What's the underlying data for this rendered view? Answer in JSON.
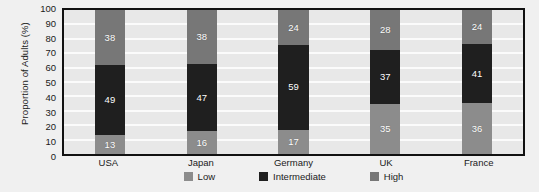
{
  "chart_data": {
    "type": "bar",
    "subtype": "stacked-column-100",
    "title": "",
    "xlabel": "",
    "ylabel": "Proportion of Adults (%)",
    "ylim": [
      0,
      100
    ],
    "yticks": [
      100,
      90,
      80,
      70,
      60,
      50,
      40,
      30,
      20,
      10,
      0
    ],
    "grid": true,
    "grid_orientation": "horizontal",
    "legend_position": "bottom-center",
    "categories": [
      "USA",
      "Japan",
      "Germany",
      "UK",
      "France"
    ],
    "stack_order_bottom_to_top": [
      "Low",
      "Intermediate",
      "High"
    ],
    "series": [
      {
        "name": "Low",
        "color": "#8c8c8c",
        "values": [
          13,
          16,
          17,
          35,
          36
        ]
      },
      {
        "name": "Intermediate",
        "color": "#1f1f1f",
        "values": [
          49,
          47,
          59,
          37,
          41
        ]
      },
      {
        "name": "High",
        "color": "#777777",
        "values": [
          38,
          38,
          24,
          28,
          24
        ]
      }
    ],
    "annotations": {
      "source_note": ""
    }
  },
  "colors": {
    "low": "#8c8c8c",
    "intermediate": "#1f1f1f",
    "high": "#777777",
    "plot_background": "#e8e8e8",
    "gridline": "#fbfbfb",
    "axis": "#111111",
    "page_background": "#f0f0f0",
    "text": "#1a1a1a",
    "data_label": "#ffffff"
  }
}
